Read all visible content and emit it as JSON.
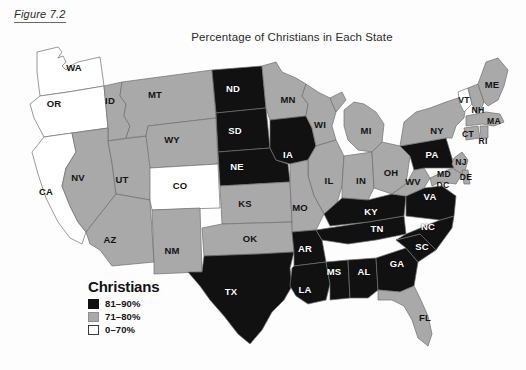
{
  "figure": {
    "caption": "Figure 7.2"
  },
  "map": {
    "title": "Percentage of Christians in Each State",
    "colors": {
      "high": "#111111",
      "mid": "#a9a9a9",
      "low": "#ffffff",
      "border": "#6f6f6f",
      "background": "#fdfdfd"
    }
  },
  "legend": {
    "title": "Christians",
    "items": [
      {
        "swatch": "black",
        "label": "81–90%"
      },
      {
        "swatch": "gray",
        "label": "71–80%"
      },
      {
        "swatch": "white",
        "label": "0–70%"
      }
    ]
  },
  "chart_data": {
    "type": "map",
    "title": "Percentage of Christians in Each State",
    "legend_title": "Christians",
    "categories": [
      "81–90%",
      "71–80%",
      "0–70%"
    ],
    "category_colors": [
      "#111111",
      "#a9a9a9",
      "#ffffff"
    ],
    "states": [
      {
        "code": "WA",
        "category": "0–70%",
        "x": 74,
        "y": 68,
        "tone": "light"
      },
      {
        "code": "OR",
        "category": "0–70%",
        "x": 54,
        "y": 104,
        "tone": "light"
      },
      {
        "code": "CA",
        "category": "0–70%",
        "x": 46,
        "y": 192,
        "tone": "light"
      },
      {
        "code": "ID",
        "category": "71–80%",
        "x": 110,
        "y": 101,
        "tone": "light"
      },
      {
        "code": "NV",
        "category": "71–80%",
        "x": 78,
        "y": 178,
        "tone": "light"
      },
      {
        "code": "UT",
        "category": "71–80%",
        "x": 122,
        "y": 180,
        "tone": "light"
      },
      {
        "code": "AZ",
        "category": "71–80%",
        "x": 110,
        "y": 240,
        "tone": "light"
      },
      {
        "code": "MT",
        "category": "71–80%",
        "x": 155,
        "y": 95,
        "tone": "light"
      },
      {
        "code": "WY",
        "category": "71–80%",
        "x": 172,
        "y": 140,
        "tone": "light"
      },
      {
        "code": "CO",
        "category": "0–70%",
        "x": 180,
        "y": 186,
        "tone": "light"
      },
      {
        "code": "NM",
        "category": "71–80%",
        "x": 172,
        "y": 251,
        "tone": "light"
      },
      {
        "code": "ND",
        "category": "81–90%",
        "x": 233,
        "y": 89,
        "tone": "dark"
      },
      {
        "code": "SD",
        "category": "81–90%",
        "x": 235,
        "y": 131,
        "tone": "dark"
      },
      {
        "code": "NE",
        "category": "81–90%",
        "x": 237,
        "y": 167,
        "tone": "dark"
      },
      {
        "code": "KS",
        "category": "71–80%",
        "x": 245,
        "y": 204,
        "tone": "light"
      },
      {
        "code": "OK",
        "category": "71–80%",
        "x": 250,
        "y": 239,
        "tone": "light"
      },
      {
        "code": "TX",
        "category": "81–90%",
        "x": 231,
        "y": 292,
        "tone": "dark"
      },
      {
        "code": "MN",
        "category": "71–80%",
        "x": 288,
        "y": 100,
        "tone": "light"
      },
      {
        "code": "IA",
        "category": "81–90%",
        "x": 288,
        "y": 155,
        "tone": "dark"
      },
      {
        "code": "MO",
        "category": "71–80%",
        "x": 300,
        "y": 208,
        "tone": "light"
      },
      {
        "code": "AR",
        "category": "81–90%",
        "x": 305,
        "y": 249,
        "tone": "dark"
      },
      {
        "code": "LA",
        "category": "81–90%",
        "x": 305,
        "y": 290,
        "tone": "dark"
      },
      {
        "code": "WI",
        "category": "71–80%",
        "x": 320,
        "y": 125,
        "tone": "light"
      },
      {
        "code": "IL",
        "category": "71–80%",
        "x": 329,
        "y": 181,
        "tone": "light"
      },
      {
        "code": "MS",
        "category": "81–90%",
        "x": 334,
        "y": 272,
        "tone": "dark"
      },
      {
        "code": "MI",
        "category": "71–80%",
        "x": 366,
        "y": 131,
        "tone": "light"
      },
      {
        "code": "IN",
        "category": "71–80%",
        "x": 361,
        "y": 181,
        "tone": "light"
      },
      {
        "code": "KY",
        "category": "81–90%",
        "x": 371,
        "y": 212,
        "tone": "dark"
      },
      {
        "code": "TN",
        "category": "81–90%",
        "x": 377,
        "y": 229,
        "tone": "dark"
      },
      {
        "code": "AL",
        "category": "81–90%",
        "x": 364,
        "y": 272,
        "tone": "dark"
      },
      {
        "code": "GA",
        "category": "81–90%",
        "x": 397,
        "y": 264,
        "tone": "dark"
      },
      {
        "code": "FL",
        "category": "71–80%",
        "x": 425,
        "y": 318,
        "tone": "light"
      },
      {
        "code": "OH",
        "category": "71–80%",
        "x": 391,
        "y": 173,
        "tone": "light"
      },
      {
        "code": "WV",
        "category": "71–80%",
        "x": 413,
        "y": 182,
        "tone": "light"
      },
      {
        "code": "VA",
        "category": "81–90%",
        "x": 430,
        "y": 197,
        "tone": "dark"
      },
      {
        "code": "NC",
        "category": "81–90%",
        "x": 428,
        "y": 227,
        "tone": "dark"
      },
      {
        "code": "SC",
        "category": "81–90%",
        "x": 422,
        "y": 247,
        "tone": "dark"
      },
      {
        "code": "NY",
        "category": "71–80%",
        "x": 437,
        "y": 131,
        "tone": "light"
      },
      {
        "code": "PA",
        "category": "81–90%",
        "x": 432,
        "y": 155,
        "tone": "dark"
      },
      {
        "code": "MD",
        "category": "71–80%",
        "x": 444,
        "y": 174,
        "tone": "light"
      },
      {
        "code": "DC",
        "category": "71–80%",
        "x": 443,
        "y": 185,
        "tone": "light"
      },
      {
        "code": "DE",
        "category": "71–80%",
        "x": 466,
        "y": 177,
        "tone": "light"
      },
      {
        "code": "NJ",
        "category": "71–80%",
        "x": 461,
        "y": 162,
        "tone": "light"
      },
      {
        "code": "CT",
        "category": "71–80%",
        "x": 468,
        "y": 134,
        "tone": "light"
      },
      {
        "code": "RI",
        "category": "71–80%",
        "x": 483,
        "y": 141,
        "tone": "light"
      },
      {
        "code": "MA",
        "category": "71–80%",
        "x": 494,
        "y": 121,
        "tone": "light"
      },
      {
        "code": "VT",
        "category": "0–70%",
        "x": 464,
        "y": 100,
        "tone": "light"
      },
      {
        "code": "NH",
        "category": "71–80%",
        "x": 478,
        "y": 110,
        "tone": "light"
      },
      {
        "code": "ME",
        "category": "71–80%",
        "x": 492,
        "y": 85,
        "tone": "light"
      }
    ]
  }
}
